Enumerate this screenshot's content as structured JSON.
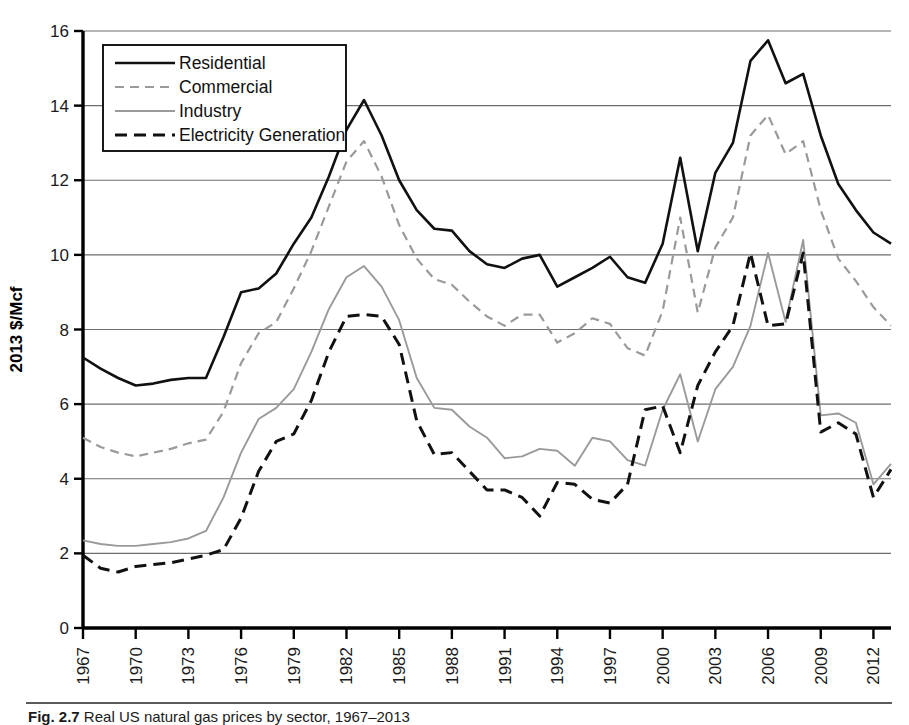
{
  "chart_data": {
    "type": "line",
    "title": "",
    "xlabel": "",
    "ylabel": "2013 $/Mcf",
    "ylim": [
      0,
      16
    ],
    "xlim": [
      1967,
      2013
    ],
    "ytick_labels": [
      "0",
      "2",
      "4",
      "6",
      "8",
      "10",
      "12",
      "14",
      "16"
    ],
    "yticks": [
      0,
      2,
      4,
      6,
      8,
      10,
      12,
      14,
      16
    ],
    "xtick_labels": [
      "1967",
      "1970",
      "1973",
      "1976",
      "1979",
      "1982",
      "1985",
      "1988",
      "1991",
      "1994",
      "1997",
      "2000",
      "2003",
      "2006",
      "2009",
      "2012"
    ],
    "xticks": [
      1967,
      1970,
      1973,
      1976,
      1979,
      1982,
      1985,
      1988,
      1991,
      1994,
      1997,
      2000,
      2003,
      2006,
      2009,
      2012
    ],
    "grid": "horizontal",
    "legend_position": "upper-left",
    "x": [
      1967,
      1968,
      1969,
      1970,
      1971,
      1972,
      1973,
      1974,
      1975,
      1976,
      1977,
      1978,
      1979,
      1980,
      1981,
      1982,
      1983,
      1984,
      1985,
      1986,
      1987,
      1988,
      1989,
      1990,
      1991,
      1992,
      1993,
      1994,
      1995,
      1996,
      1997,
      1998,
      1999,
      2000,
      2001,
      2002,
      2003,
      2004,
      2005,
      2006,
      2007,
      2008,
      2009,
      2010,
      2011,
      2012,
      2013
    ],
    "series": [
      {
        "name": "Residential",
        "color": "#111111",
        "style": "solid",
        "values": [
          7.25,
          6.95,
          6.7,
          6.5,
          6.55,
          6.65,
          6.7,
          6.7,
          7.8,
          9.0,
          9.1,
          9.5,
          10.3,
          11.0,
          12.1,
          13.35,
          14.15,
          13.2,
          12.0,
          11.2,
          10.7,
          10.65,
          10.1,
          9.75,
          9.65,
          9.9,
          10.0,
          9.15,
          9.4,
          9.65,
          9.95,
          9.4,
          9.25,
          10.3,
          12.6,
          10.1,
          12.2,
          13.0,
          15.2,
          15.75,
          14.6,
          14.85,
          13.2,
          11.9,
          11.2,
          10.6,
          10.3
        ]
      },
      {
        "name": "Commercial",
        "color": "#9a9a9a",
        "style": "dashed",
        "values": [
          5.1,
          4.85,
          4.7,
          4.6,
          4.7,
          4.8,
          4.95,
          5.05,
          5.8,
          7.1,
          7.9,
          8.2,
          9.1,
          10.1,
          11.3,
          12.5,
          13.05,
          12.1,
          10.8,
          9.9,
          9.35,
          9.2,
          8.75,
          8.35,
          8.1,
          8.4,
          8.4,
          7.65,
          7.9,
          8.3,
          8.15,
          7.5,
          7.3,
          8.5,
          11.0,
          8.45,
          10.2,
          11.0,
          13.2,
          13.75,
          12.7,
          13.05,
          11.2,
          9.9,
          9.3,
          8.6,
          8.1
        ]
      },
      {
        "name": "Industry",
        "color": "#9a9a9a",
        "style": "solid",
        "values": [
          2.35,
          2.25,
          2.2,
          2.2,
          2.25,
          2.3,
          2.4,
          2.6,
          3.5,
          4.7,
          5.6,
          5.9,
          6.4,
          7.4,
          8.55,
          9.4,
          9.7,
          9.15,
          8.25,
          6.7,
          5.9,
          5.85,
          5.4,
          5.1,
          4.55,
          4.6,
          4.8,
          4.75,
          4.35,
          5.1,
          5.0,
          4.5,
          4.35,
          5.85,
          6.8,
          5.0,
          6.4,
          7.0,
          8.1,
          10.05,
          8.2,
          10.4,
          5.7,
          5.75,
          5.5,
          3.85,
          4.4
        ]
      },
      {
        "name": "Electricity Generation",
        "color": "#111111",
        "style": "dashed",
        "values": [
          1.95,
          1.6,
          1.5,
          1.65,
          1.7,
          1.75,
          1.85,
          1.95,
          2.1,
          2.95,
          4.2,
          5.0,
          5.2,
          6.1,
          7.4,
          8.35,
          8.4,
          8.35,
          7.6,
          5.55,
          4.65,
          4.7,
          4.2,
          3.7,
          3.7,
          3.5,
          3.0,
          3.9,
          3.85,
          3.45,
          3.35,
          3.85,
          5.85,
          5.95,
          4.7,
          6.5,
          7.4,
          8.1,
          10.05,
          8.1,
          8.15,
          10.05,
          5.25,
          5.5,
          5.2,
          3.5,
          4.25
        ]
      }
    ]
  },
  "legend": {
    "entries": [
      {
        "label": "Residential"
      },
      {
        "label": "Commercial"
      },
      {
        "label": "Industry"
      },
      {
        "label": "Electricity Generation"
      }
    ]
  },
  "caption": {
    "figure_number": "Fig. 2.7",
    "text": "Real US natural gas prices by sector, 1967–2013"
  }
}
